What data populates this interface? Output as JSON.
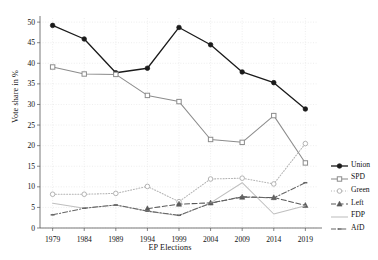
{
  "chart_data": {
    "type": "line",
    "title": "",
    "xlabel": "EP Elections",
    "ylabel": "Vote share in %",
    "categories": [
      "1979",
      "1984",
      "1989",
      "1994",
      "1999",
      "2004",
      "2009",
      "2014",
      "2019"
    ],
    "x": [
      1979,
      1984,
      1989,
      1994,
      1999,
      2004,
      2009,
      2014,
      2019
    ],
    "xlim": [
      1977,
      2021
    ],
    "ylim": [
      0,
      51
    ],
    "yticks": [
      0,
      5,
      10,
      15,
      20,
      25,
      30,
      35,
      40,
      45,
      50
    ],
    "xticks": [
      1979,
      1984,
      1989,
      1994,
      1999,
      2004,
      2009,
      2014,
      2019
    ],
    "grid": true,
    "legend_position": "right",
    "series": [
      {
        "name": "Union",
        "color": "#1a1a1a",
        "marker": "filled-circle",
        "dash": "solid",
        "x": [
          1979,
          1984,
          1989,
          1994,
          1999,
          2004,
          2009,
          2014,
          2019
        ],
        "values": [
          49.2,
          45.9,
          37.7,
          38.8,
          48.7,
          44.5,
          37.9,
          35.3,
          28.9
        ]
      },
      {
        "name": "SPD",
        "color": "#8c8c8c",
        "marker": "open-square",
        "dash": "solid",
        "x": [
          1979,
          1984,
          1989,
          1994,
          1999,
          2004,
          2009,
          2014,
          2019
        ],
        "values": [
          39.1,
          37.4,
          37.3,
          32.2,
          30.7,
          21.5,
          20.8,
          27.3,
          15.8
        ]
      },
      {
        "name": "Green",
        "color": "#b3b3b3",
        "marker": "open-circle",
        "dash": "dotted",
        "x": [
          1979,
          1984,
          1989,
          1994,
          1999,
          2004,
          2009,
          2014,
          2019
        ],
        "values": [
          8.2,
          8.2,
          8.4,
          10.1,
          6.4,
          11.9,
          12.1,
          10.7,
          20.5
        ]
      },
      {
        "name": "Left",
        "color": "#595959",
        "marker": "filled-triangle",
        "dash": "dashed",
        "x": [
          1994,
          1999,
          2004,
          2009,
          2014,
          2019
        ],
        "values": [
          4.7,
          5.8,
          6.1,
          7.5,
          7.4,
          5.5
        ]
      },
      {
        "name": "FDP",
        "color": "#bfbfbf",
        "marker": "none",
        "dash": "solid",
        "x": [
          1979,
          1984,
          1989,
          1994,
          1999,
          2004,
          2009,
          2014,
          2019
        ],
        "values": [
          6.0,
          4.8,
          5.6,
          4.1,
          3.0,
          6.1,
          11.0,
          3.4,
          5.4
        ]
      },
      {
        "name": "AfD",
        "color": "#666666",
        "marker": "small-dash",
        "dash": "dashdot",
        "x": [
          1979,
          1984,
          1989,
          1994,
          1999,
          2004,
          2009,
          2014,
          2019
        ],
        "values": [
          3.2,
          4.8,
          5.6,
          4.1,
          3.1,
          6.0,
          7.6,
          7.3,
          11.0
        ]
      }
    ]
  },
  "axes": {
    "y_label": "Vote share in %",
    "x_label": "EP Elections",
    "y_tick_labels": [
      "0",
      "5",
      "10",
      "15",
      "20",
      "25",
      "30",
      "35",
      "40",
      "45",
      "50"
    ],
    "x_tick_labels": [
      "1979",
      "1984",
      "1989",
      "1994",
      "1999",
      "2004",
      "2009",
      "2014",
      "2019"
    ]
  },
  "legend": {
    "entries": [
      {
        "label": "Union"
      },
      {
        "label": "SPD"
      },
      {
        "label": "Green"
      },
      {
        "label": "Left"
      },
      {
        "label": "FDP"
      },
      {
        "label": "AfD"
      }
    ]
  },
  "colors": {
    "grid": "#e2e2e2",
    "axis": "#555555",
    "background": "#ffffff"
  }
}
